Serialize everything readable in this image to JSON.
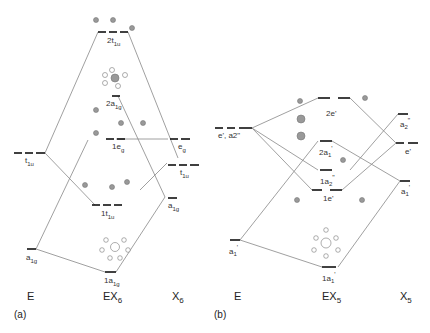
{
  "panel_a": {
    "tag": "(a)",
    "columns": {
      "left": "E",
      "center": "EX",
      "center_sub": "6",
      "right": "X",
      "right_sub": "6"
    },
    "levels": {
      "t1u_left": {
        "base": "t",
        "sub": "1u"
      },
      "a1g_left": {
        "base": "a",
        "sub": "1g"
      },
      "2t1u": {
        "base": "2t",
        "sub": "1u"
      },
      "2a1g": {
        "base": "2a",
        "sub": "1g"
      },
      "1eg": {
        "base": "1e",
        "sub": "g"
      },
      "1t1u": {
        "base": "1t",
        "sub": "1u"
      },
      "1a1g": {
        "base": "1a",
        "sub": "1g"
      },
      "eg_right": {
        "base": "e",
        "sub": "g"
      },
      "t1u_right": {
        "base": "t",
        "sub": "1u"
      },
      "a1g_right": {
        "base": "a",
        "sub": "1g"
      }
    }
  },
  "panel_b": {
    "tag": "(b)",
    "columns": {
      "left": "E",
      "center": "EX",
      "center_sub": "5",
      "right": "X",
      "right_sub": "5"
    },
    "levels": {
      "e_a2_left": {
        "base": "e', a2\""
      },
      "a1_left": {
        "base": "a",
        "sub": "1",
        "sup": "'"
      },
      "2e": {
        "base": "2e'"
      },
      "2a1": {
        "base": "2a",
        "sub": "1",
        "sup": "'"
      },
      "1a2": {
        "base": "1a",
        "sub": "2",
        "sup": "\""
      },
      "1e": {
        "base": "1e'"
      },
      "1a1": {
        "base": "1a",
        "sub": "1",
        "sup": "'"
      },
      "a2_right": {
        "base": "a",
        "sub": "2",
        "sup": "\""
      },
      "e_right": {
        "base": "e'"
      },
      "a1_right": {
        "base": "a",
        "sub": "1",
        "sup": "'"
      }
    }
  }
}
